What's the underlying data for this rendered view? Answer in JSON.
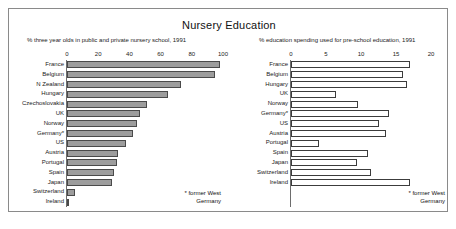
{
  "title": "Nursery Education",
  "footnote": "* former West Germany",
  "chart_data": [
    {
      "type": "bar",
      "orientation": "horizontal",
      "panel": "left",
      "title": "Nursery Education",
      "subtitle": "% three year olds in public and private nursery school, 1991",
      "xlabel": "",
      "ylabel": "",
      "xlim": [
        0,
        100
      ],
      "xticks": [
        0,
        20,
        40,
        60,
        80,
        100
      ],
      "grid": false,
      "legend": "none",
      "bar_style": "gray-filled",
      "bar_color": "#9d9d9d",
      "bar_border": "#4a4a4a",
      "categories": [
        "France",
        "Belgium",
        "N Zealand",
        "Hungary",
        "Czechoslovakia",
        "UK",
        "Norway",
        "Germany*",
        "US",
        "Austria",
        "Portugal",
        "Spain",
        "Japan",
        "Switzerland",
        "Ireland"
      ],
      "values": [
        98,
        95,
        73,
        65,
        51,
        47,
        45,
        42,
        38,
        33,
        32,
        30,
        29,
        5,
        1
      ],
      "annotation": "* former West Germany"
    },
    {
      "type": "bar",
      "orientation": "horizontal",
      "panel": "right",
      "title": "Nursery Education",
      "subtitle": "% education spending used for pre-school education, 1991",
      "xlabel": "",
      "ylabel": "",
      "xlim": [
        0,
        20
      ],
      "xticks": [
        0,
        5,
        10,
        15,
        20
      ],
      "grid": false,
      "legend": "none",
      "bar_style": "hollow-outline",
      "bar_color": "#ffffff",
      "bar_border": "#3c3c3c",
      "categories": [
        "France",
        "Belgium",
        "Hungary",
        "UK",
        "Norway",
        "Germany*",
        "US",
        "Austria",
        "Portugal",
        "Spain",
        "Japan",
        "Switzerland",
        "Ireland"
      ],
      "values": [
        17.0,
        16.0,
        16.6,
        6.4,
        9.6,
        14.0,
        12.6,
        13.6,
        4.0,
        11.0,
        9.4,
        11.4,
        17.0
      ],
      "annotation": "* former West Germany"
    }
  ]
}
